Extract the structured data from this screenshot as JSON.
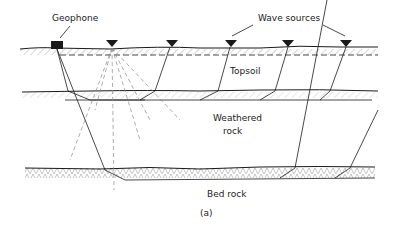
{
  "diagram": {
    "labels": {
      "geophone": "Geophone",
      "wave_sources": "Wave sources",
      "topsoil": "Topsoil",
      "weathered": "Weathered",
      "rock": "rock",
      "bed_rock": "Bed rock",
      "caption": "(a)"
    },
    "layers": [
      "Topsoil",
      "Weathered rock",
      "Bed rock"
    ],
    "colors": {
      "ink": "#1a1a1a",
      "hatch": "#999999"
    }
  }
}
